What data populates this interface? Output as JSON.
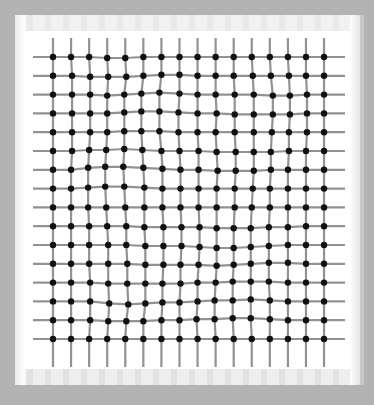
{
  "figure": {
    "background_color": "#b3b3b3",
    "panel_color": "#ffffff",
    "line_color": "#6d6d6d",
    "node_color": "#111111"
  },
  "grid": {
    "rows": 16,
    "cols": 16,
    "origin_x": 53,
    "origin_y": 57,
    "spacing_x": 18.07,
    "spacing_y": 18.8,
    "h_line_extent": [
      33,
      345
    ],
    "v_line_extent": [
      38,
      367
    ],
    "node_radius": 3.2,
    "displacements": [
      [
        [
          0,
          0
        ],
        [
          0,
          0
        ],
        [
          0,
          0
        ],
        [
          0,
          1
        ],
        [
          0,
          1
        ],
        [
          0,
          0
        ],
        [
          0,
          0
        ],
        [
          0,
          0
        ],
        [
          0,
          0
        ],
        [
          0,
          0
        ],
        [
          0,
          0
        ],
        [
          0,
          0
        ],
        [
          0,
          0
        ],
        [
          0,
          0
        ],
        [
          0,
          0
        ],
        [
          0,
          0
        ]
      ],
      [
        [
          0,
          0
        ],
        [
          1,
          0
        ],
        [
          1,
          1
        ],
        [
          1,
          1
        ],
        [
          1,
          1
        ],
        [
          0,
          0
        ],
        [
          0,
          -1
        ],
        [
          0,
          -1
        ],
        [
          0,
          0
        ],
        [
          0,
          0
        ],
        [
          0,
          0
        ],
        [
          1,
          0
        ],
        [
          1,
          0
        ],
        [
          1,
          0
        ],
        [
          0,
          0
        ],
        [
          0,
          0
        ]
      ],
      [
        [
          0,
          0
        ],
        [
          1,
          0
        ],
        [
          1,
          0
        ],
        [
          0,
          1
        ],
        [
          -1,
          0
        ],
        [
          -2,
          -1
        ],
        [
          -2,
          -2
        ],
        [
          0,
          -1
        ],
        [
          0,
          0
        ],
        [
          0,
          0
        ],
        [
          1,
          0
        ],
        [
          2,
          0
        ],
        [
          3,
          1
        ],
        [
          2,
          1
        ],
        [
          1,
          0
        ],
        [
          0,
          0
        ]
      ],
      [
        [
          0,
          0
        ],
        [
          1,
          0
        ],
        [
          1,
          0
        ],
        [
          0,
          0
        ],
        [
          -1,
          -1
        ],
        [
          -2,
          -2
        ],
        [
          -2,
          -2
        ],
        [
          -1,
          -1
        ],
        [
          0,
          0
        ],
        [
          1,
          0
        ],
        [
          1,
          1
        ],
        [
          2,
          1
        ],
        [
          3,
          1
        ],
        [
          2,
          1
        ],
        [
          1,
          0
        ],
        [
          0,
          0
        ]
      ],
      [
        [
          0,
          0
        ],
        [
          1,
          0
        ],
        [
          1,
          0
        ],
        [
          0,
          0
        ],
        [
          -1,
          -1
        ],
        [
          -2,
          -1
        ],
        [
          -2,
          -1
        ],
        [
          -1,
          0
        ],
        [
          0,
          0
        ],
        [
          0,
          0
        ],
        [
          1,
          0
        ],
        [
          2,
          0
        ],
        [
          2,
          0
        ],
        [
          1,
          0
        ],
        [
          1,
          0
        ],
        [
          0,
          0
        ]
      ],
      [
        [
          0,
          0
        ],
        [
          1,
          0
        ],
        [
          0,
          -1
        ],
        [
          -1,
          -1
        ],
        [
          -1,
          -2
        ],
        [
          -1,
          -1
        ],
        [
          0,
          0
        ],
        [
          0,
          0
        ],
        [
          1,
          0
        ],
        [
          1,
          1
        ],
        [
          2,
          1
        ],
        [
          2,
          1
        ],
        [
          1,
          1
        ],
        [
          1,
          0
        ],
        [
          0,
          0
        ],
        [
          0,
          0
        ]
      ],
      [
        [
          0,
          0
        ],
        [
          0,
          0
        ],
        [
          -1,
          -2
        ],
        [
          -2,
          -3
        ],
        [
          -2,
          -3
        ],
        [
          0,
          -2
        ],
        [
          1,
          -1
        ],
        [
          1,
          0
        ],
        [
          1,
          0
        ],
        [
          2,
          1
        ],
        [
          2,
          1
        ],
        [
          2,
          1
        ],
        [
          1,
          0
        ],
        [
          0,
          0
        ],
        [
          0,
          0
        ],
        [
          0,
          0
        ]
      ],
      [
        [
          0,
          0
        ],
        [
          0,
          0
        ],
        [
          -1,
          -1
        ],
        [
          -2,
          -2
        ],
        [
          -1,
          -2
        ],
        [
          1,
          -1
        ],
        [
          1,
          0
        ],
        [
          1,
          0
        ],
        [
          1,
          0
        ],
        [
          1,
          0
        ],
        [
          1,
          0
        ],
        [
          1,
          0
        ],
        [
          0,
          0
        ],
        [
          0,
          0
        ],
        [
          0,
          0
        ],
        [
          0,
          0
        ]
      ],
      [
        [
          0,
          0
        ],
        [
          0,
          0
        ],
        [
          -1,
          0
        ],
        [
          -1,
          0
        ],
        [
          0,
          0
        ],
        [
          1,
          0
        ],
        [
          1,
          0
        ],
        [
          1,
          0
        ],
        [
          1,
          0
        ],
        [
          1,
          0
        ],
        [
          1,
          0
        ],
        [
          0,
          0
        ],
        [
          0,
          0
        ],
        [
          0,
          0
        ],
        [
          0,
          0
        ],
        [
          0,
          0
        ]
      ],
      [
        [
          0,
          0
        ],
        [
          0,
          0
        ],
        [
          0,
          0
        ],
        [
          0,
          0
        ],
        [
          1,
          0
        ],
        [
          1,
          1
        ],
        [
          2,
          1
        ],
        [
          2,
          1
        ],
        [
          2,
          1
        ],
        [
          1,
          2
        ],
        [
          0,
          2
        ],
        [
          -1,
          2
        ],
        [
          -1,
          1
        ],
        [
          0,
          1
        ],
        [
          0,
          0
        ],
        [
          0,
          0
        ]
      ],
      [
        [
          0,
          0
        ],
        [
          0,
          0
        ],
        [
          0,
          0
        ],
        [
          1,
          0
        ],
        [
          1,
          0
        ],
        [
          2,
          1
        ],
        [
          2,
          1
        ],
        [
          2,
          1
        ],
        [
          2,
          2
        ],
        [
          1,
          3
        ],
        [
          0,
          3
        ],
        [
          -1,
          2
        ],
        [
          -1,
          1
        ],
        [
          0,
          0
        ],
        [
          0,
          0
        ],
        [
          0,
          0
        ]
      ],
      [
        [
          0,
          0
        ],
        [
          0,
          0
        ],
        [
          0,
          0
        ],
        [
          1,
          0
        ],
        [
          2,
          0
        ],
        [
          2,
          1
        ],
        [
          2,
          1
        ],
        [
          1,
          1
        ],
        [
          1,
          1
        ],
        [
          1,
          2
        ],
        [
          0,
          1
        ],
        [
          -1,
          0
        ],
        [
          -1,
          -1
        ],
        [
          0,
          -1
        ],
        [
          0,
          0
        ],
        [
          0,
          0
        ]
      ],
      [
        [
          0,
          0
        ],
        [
          0,
          0
        ],
        [
          1,
          0
        ],
        [
          1,
          1
        ],
        [
          2,
          1
        ],
        [
          2,
          1
        ],
        [
          1,
          1
        ],
        [
          1,
          1
        ],
        [
          0,
          0
        ],
        [
          0,
          0
        ],
        [
          -1,
          -1
        ],
        [
          -1,
          -1
        ],
        [
          -1,
          -1
        ],
        [
          0,
          0
        ],
        [
          0,
          0
        ],
        [
          0,
          0
        ]
      ],
      [
        [
          0,
          0
        ],
        [
          0,
          0
        ],
        [
          1,
          0
        ],
        [
          2,
          2
        ],
        [
          3,
          3
        ],
        [
          2,
          2
        ],
        [
          1,
          1
        ],
        [
          0,
          1
        ],
        [
          0,
          0
        ],
        [
          -1,
          -1
        ],
        [
          -1,
          -1
        ],
        [
          -1,
          -2
        ],
        [
          0,
          -1
        ],
        [
          0,
          0
        ],
        [
          0,
          0
        ],
        [
          0,
          0
        ]
      ],
      [
        [
          0,
          0
        ],
        [
          0,
          0
        ],
        [
          1,
          0
        ],
        [
          1,
          1
        ],
        [
          1,
          1
        ],
        [
          0,
          1
        ],
        [
          0,
          0
        ],
        [
          0,
          0
        ],
        [
          -1,
          -1
        ],
        [
          -1,
          -1
        ],
        [
          -1,
          -2
        ],
        [
          -1,
          -2
        ],
        [
          0,
          -1
        ],
        [
          0,
          0
        ],
        [
          0,
          0
        ],
        [
          0,
          0
        ]
      ],
      [
        [
          0,
          0
        ],
        [
          0,
          0
        ],
        [
          0,
          0
        ],
        [
          0,
          0
        ],
        [
          0,
          0
        ],
        [
          0,
          0
        ],
        [
          0,
          0
        ],
        [
          0,
          0
        ],
        [
          0,
          0
        ],
        [
          0,
          0
        ],
        [
          0,
          0
        ],
        [
          0,
          0
        ],
        [
          0,
          0
        ],
        [
          0,
          0
        ],
        [
          0,
          0
        ],
        [
          0,
          0
        ]
      ]
    ]
  }
}
